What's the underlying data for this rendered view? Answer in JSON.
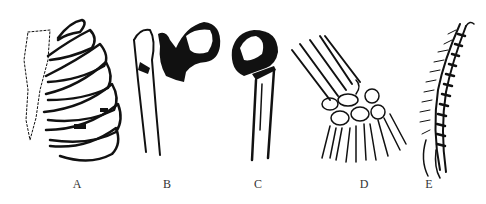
{
  "figure": {
    "panels": [
      {
        "id": "A",
        "label": "A",
        "subject": "rib-cage"
      },
      {
        "id": "B",
        "label": "B",
        "subject": "femur-head-with-neck"
      },
      {
        "id": "C",
        "label": "C",
        "subject": "fractured-femur-head"
      },
      {
        "id": "D",
        "label": "D",
        "subject": "wrist-and-hand-bones"
      },
      {
        "id": "E",
        "label": "E",
        "subject": "vertebral-column"
      }
    ],
    "colors": {
      "ink": "#111111",
      "background": "#ffffff",
      "label": "#333333"
    }
  }
}
